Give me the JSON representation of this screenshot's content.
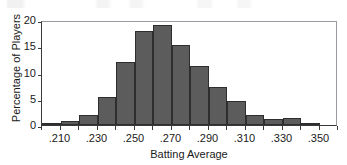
{
  "chart_data": {
    "type": "bar",
    "title": "",
    "xlabel": "Batting Average",
    "ylabel": "Percentage of Players",
    "grid": false,
    "legend": false,
    "bin_width": 0.01,
    "xlim": [
      0.2,
      0.36
    ],
    "ylim": [
      0,
      20
    ],
    "yticks": [
      0,
      5,
      10,
      15,
      20
    ],
    "ytick_labels": [
      "0",
      "5",
      "10",
      "15",
      "20"
    ],
    "xticks": [
      0.21,
      0.23,
      0.25,
      0.27,
      0.29,
      0.31,
      0.33,
      0.35
    ],
    "xtick_labels": [
      ".210",
      ".230",
      ".250",
      ".270",
      ".290",
      ".310",
      ".330",
      ".350"
    ],
    "bin_edges": [
      0.2,
      0.21,
      0.22,
      0.23,
      0.24,
      0.25,
      0.26,
      0.27,
      0.28,
      0.29,
      0.3,
      0.31,
      0.32,
      0.33,
      0.34,
      0.35,
      0.36
    ],
    "categories": [
      ".200-.210",
      ".210-.220",
      ".220-.230",
      ".230-.240",
      ".240-.250",
      ".250-.260",
      ".260-.270",
      ".270-.280",
      ".280-.290",
      ".290-.300",
      ".300-.310",
      ".310-.320",
      ".320-.330",
      ".330-.340",
      ".340-.350",
      ".350-.360"
    ],
    "values": [
      0.3,
      0.7,
      2.0,
      5.4,
      12.0,
      18.0,
      19.0,
      15.3,
      11.3,
      7.3,
      4.5,
      2.0,
      1.2,
      1.4,
      0.2,
      0.0
    ],
    "bar_color": "#5c5c5c",
    "bar_edge_color": "#2e2e2e",
    "axis_color": "#3a3a3a",
    "background_color": "#ffffff"
  }
}
